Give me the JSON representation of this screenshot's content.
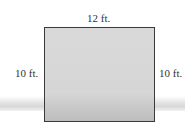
{
  "diagram": {
    "shape": "rectangle",
    "dimensions": {
      "top": "12 ft.",
      "left": "10 ft.",
      "right": "10 ft."
    },
    "colors": {
      "fill": "#d6d6d6",
      "border": "#3a3a3a",
      "text": "#333333"
    }
  }
}
